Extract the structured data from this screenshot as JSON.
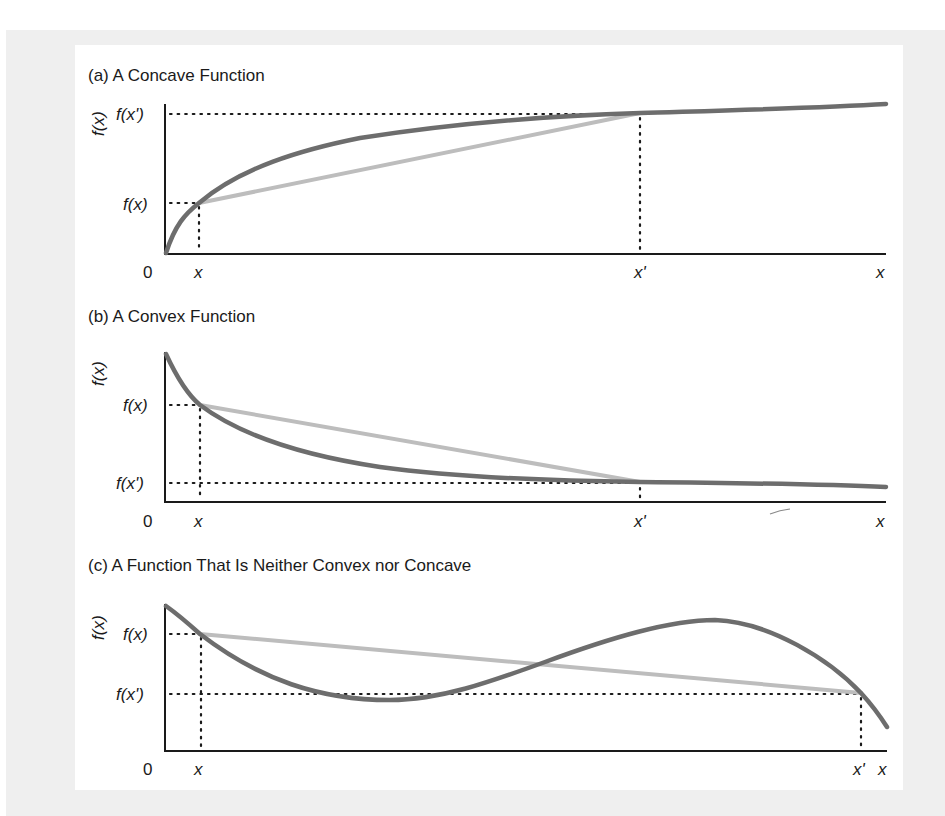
{
  "figure": {
    "panels": [
      {
        "id": "a",
        "title": "(a) A Concave Function",
        "y_axis_label": "f(x)",
        "y_ticks": [
          "f(x')",
          "f(x)"
        ],
        "x_ticks": [
          "0",
          "x",
          "x'",
          "x"
        ]
      },
      {
        "id": "b",
        "title": "(b) A Convex Function",
        "y_axis_label": "f(x)",
        "y_ticks": [
          "f(x)",
          "f(x')"
        ],
        "x_ticks": [
          "0",
          "x",
          "x'",
          "x"
        ]
      },
      {
        "id": "c",
        "title": "(c) A Function That Is Neither Convex nor Concave",
        "y_axis_label": "f(x)",
        "y_ticks": [
          "f(x)",
          "f(x')"
        ],
        "x_ticks": [
          "0",
          "x",
          "x'",
          "x"
        ]
      }
    ],
    "colors": {
      "curve": "#6d6d6d",
      "chord": "#bdbdbd",
      "axis": "#1a1a1a",
      "frame": "#efefef"
    }
  }
}
